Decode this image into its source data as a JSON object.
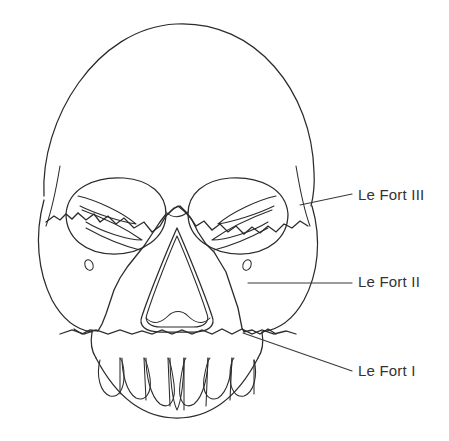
{
  "figure": {
    "title": "Le Fort fracture classification of the midface",
    "view": "anterior view of human skull",
    "background_color": "#ffffff",
    "line_color": "#2b2b2b",
    "label_color": "#333333"
  },
  "labels": [
    {
      "id": "le-fort-3",
      "text": "Le Fort III",
      "x": 358,
      "y": 196,
      "leader": "M300,205 L352,194"
    },
    {
      "id": "le-fort-2",
      "text": "Le Fort II",
      "x": 358,
      "y": 283,
      "leader": "M248,283 L352,283"
    },
    {
      "id": "le-fort-1",
      "text": "Le Fort I",
      "x": 358,
      "y": 372,
      "leader": "M243,333 L352,371"
    }
  ],
  "anatomy": {
    "cranial_vault": "M44,196 C40,120 96,28 176,24 C256,20 312,92 314,172 C315,188 313,198 311,206",
    "left_temporal_edge": "M60,166 C56,190 52,210 46,226",
    "right_temporal_edge": "M296,166 C300,190 304,210 310,226",
    "face_left_border": "M44,200 C34,236 38,272 52,300 C64,322 78,330 92,332",
    "face_right_border": "M312,206 C322,240 318,274 304,300 C292,322 276,330 262,332",
    "left_orbit": "M66,214 C68,188 96,176 124,178 C150,180 166,194 166,214 C166,238 142,254 114,254 C86,254 66,238 66,214",
    "right_orbit": "M188,214 C188,194 204,180 230,178 C258,176 286,188 288,214 C288,238 268,254 240,254 C212,254 188,238 188,214",
    "left_orbit_inner_a": "M78,196 C96,200 122,212 136,224 C122,222 96,214 80,206",
    "left_orbit_inner_b": "M82,210 C104,218 128,230 142,240 C128,240 102,232 86,222",
    "left_orbit_inner_c": "M86,228 C104,238 124,246 140,250",
    "right_orbit_inner_a": "M276,196 C258,200 232,212 218,224 C232,222 258,214 274,206",
    "right_orbit_inner_b": "M272,210 C250,218 226,230 212,240 C226,240 252,232 268,222",
    "right_orbit_inner_c": "M268,228 C250,238 230,246 214,250",
    "nasal_aperture_outer": "M177,228 C168,248 150,292 142,316 C138,326 146,332 160,332 L194,332 C208,332 216,326 212,316 C204,292 186,248 177,228",
    "nasal_aperture_inner": "M177,236 C169,254 154,292 147,314 C144,322 150,327 161,327 L193,327 C204,327 210,322 207,314 C200,292 185,254 177,236",
    "nasal_sill": "M146,318 C154,326 162,322 168,316 C174,310 182,310 188,316 C194,322 202,326 210,318",
    "left_infraorbital_foramen": {
      "cx": 89,
      "cy": 265,
      "rx": 4,
      "ry": 5.5,
      "rot": -22
    },
    "right_infraorbital_foramen": {
      "cx": 247,
      "cy": 265,
      "rx": 4,
      "ry": 5.5,
      "rot": 22
    },
    "nasal_root_bridge": "M166,212 C172,218 180,218 188,212",
    "maxilla_left_edge": "M92,332 C90,344 92,352 96,358",
    "maxilla_right_edge": "M262,332 C264,344 262,352 258,358",
    "dental_arch": "M96,358 C120,404 150,418 177,418 C204,418 234,404 258,358",
    "teeth": [
      "M100,360 C96,376 100,392 110,396 C118,398 124,390 124,376 C124,366 122,360 120,358",
      "M122,358 C122,372 126,392 136,398 C146,402 152,392 150,378 C148,366 146,360 144,358",
      "M146,358 C146,374 150,396 160,404 C170,410 176,400 174,384 C172,370 170,360 168,358",
      "M170,358 C170,376 172,400 177,410 C182,400 184,376 184,358",
      "M186,358 C184,360 182,370 180,384 C178,400 184,410 194,404 C204,396 208,374 208,358",
      "M210,358 C208,360 206,366 204,378 C202,392 208,402 218,398 C228,392 232,372 232,358",
      "M234,358 C232,360 230,366 230,376 C230,390 236,398 244,396 C254,392 258,376 254,360"
    ],
    "teeth_dividers": [
      "M120,358 L120,394",
      "M144,358 L146,400",
      "M168,358 L170,406",
      "M184,358 L184,410",
      "M208,358 L206,406",
      "M232,358 L230,400",
      "M254,360 L254,394"
    ]
  },
  "fracture_lines": {
    "le_fort_3": "M46,222 L54,216 L60,220 L66,214 L72,219 L78,213 L86,220 L94,214 L100,222 L108,216 L116,224 L124,218 L134,228 L144,222 L152,232 L160,226 L166,216 L172,210 L178,206 L184,211 L190,217 L196,226 L204,221 L212,230 L220,224 L228,232 L236,226 L244,234 L252,227 L260,233 L268,226 L276,232 L284,224 L292,228 L300,221 L308,226",
    "le_fort_2": "M168,214 L174,208 L180,206 L186,212 L192,220 L198,232 L206,244 L214,252 L220,262 L226,272 L230,284 L234,296 L238,308 L240,318 L242,328 L244,332 L252,330 L260,334 L268,329 L276,334",
    "le_fort_2_left": "M166,214 L160,222 L152,234 L144,246 L136,256 L128,266 L120,278 L114,290 L110,302 L106,314 L102,324 L98,331 L90,330 L82,334 L74,329",
    "le_fort_1": "M60,334 L72,330 L84,334 L96,330 L108,334 L120,330 L132,334 L142,331 L152,334 L162,330 L172,334 L182,330 L192,334 L202,330 L212,334 L222,329 L232,334 L242,329 L252,334 L262,330 L274,334 L286,331 L296,334"
  }
}
